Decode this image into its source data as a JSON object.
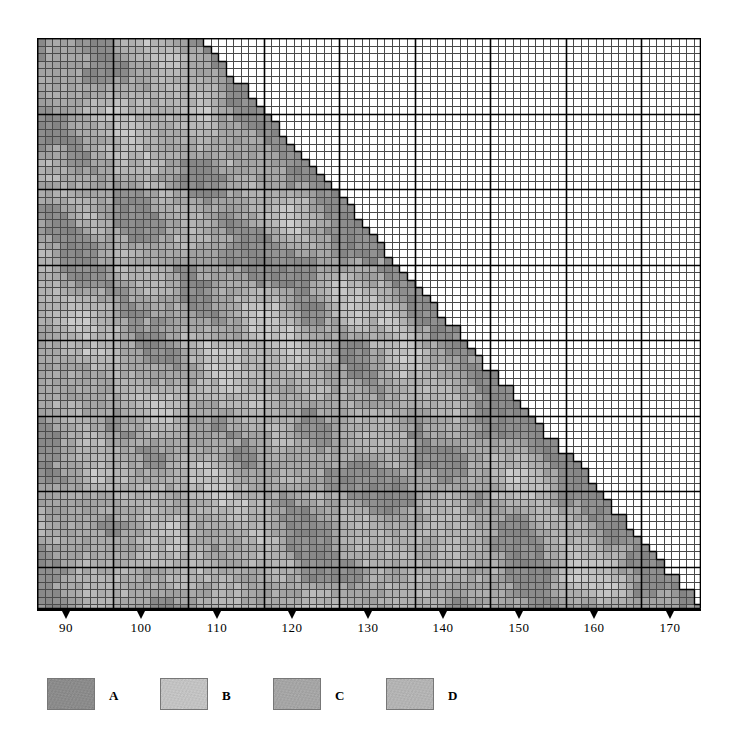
{
  "figure": {
    "background_color": "#ffffff",
    "width": 740,
    "height": 749
  },
  "plot": {
    "left": 37,
    "top": 38,
    "width": 664,
    "height": 571,
    "cell_size": 7.55,
    "major_every": 10,
    "grid_minor_color": "#4a4a4a",
    "grid_major_color": "#000000",
    "empty_cell_color": "#ffffff"
  },
  "x_axis": {
    "tick_values": [
      90,
      100,
      110,
      120,
      130,
      140,
      150,
      160,
      170
    ],
    "tick_labels": [
      "90",
      "100",
      "110",
      "120",
      "130",
      "140",
      "150",
      "160",
      "170"
    ],
    "tick_pixel_x": [
      66,
      141,
      217,
      292,
      368,
      443,
      519,
      594,
      670
    ],
    "axis_line_color": "#000000",
    "domain_min": 86.2,
    "domain_max": 174.0
  },
  "legend": {
    "entries": [
      {
        "key": "A",
        "label": "A",
        "color": "#8c8c8c",
        "border_color": "#777777"
      },
      {
        "key": "B",
        "label": "B",
        "color": "#c3c3c3",
        "border_color": "#777777"
      },
      {
        "key": "C",
        "label": "C",
        "color": "#a6a6a6",
        "border_color": "#777777"
      },
      {
        "key": "D",
        "label": "D",
        "color": "#b4b4b4",
        "border_color": "#777777"
      }
    ],
    "entry_pixel_x": [
      0,
      113,
      226,
      339
    ]
  },
  "chart_data": {
    "type": "heatmap",
    "title": "",
    "subtitle": "",
    "xlabel": "",
    "ylabel": "",
    "grid": true,
    "legend_position": "bottom-left",
    "shape": "lower-left-triangle",
    "columns": 88,
    "rows": 76,
    "x_tick_labels": [
      "90",
      "100",
      "110",
      "120",
      "130",
      "140",
      "150",
      "160",
      "170"
    ],
    "x_tick_values": [
      90,
      100,
      110,
      120,
      130,
      140,
      150,
      160,
      170
    ],
    "xlim": [
      86.2,
      174.0
    ],
    "classes": [
      {
        "key": "A",
        "label": "A",
        "color": "#8c8c8c",
        "gray_value": 140,
        "meaning": "darkest shading class, forms the band hugging the diagonal edge and scattered dark blocks"
      },
      {
        "key": "B",
        "label": "B",
        "color": "#c3c3c3",
        "gray_value": 195,
        "meaning": "lightest shading class, forms pale diagonal streaks and patches"
      },
      {
        "key": "C",
        "label": "C",
        "color": "#a6a6a6",
        "gray_value": 166,
        "meaning": "mid-dark shading class, general background of the triangle"
      },
      {
        "key": "D",
        "label": "D",
        "color": "#b4b4b4",
        "gray_value": 180,
        "meaning": "mid-light shading class, diffuse patches through the interior"
      }
    ],
    "value_range": [
      130,
      205
    ],
    "diagonal_band": {
      "class": "A",
      "width_cells": 3,
      "note": "a darker ridge of cells runs parallel to the stepped hypotenuse along the right/lower edge of the filled triangle"
    },
    "light_streaks": {
      "class": "B",
      "note": "several lighter diagonal lineaments run from the upper-left toward the lower-right across the filled region"
    }
  }
}
